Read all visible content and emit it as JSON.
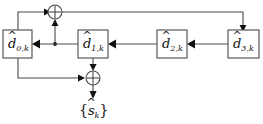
{
  "diagram": {
    "colors": {
      "line": "#4a4a4a",
      "arrow": "#111111",
      "box_fill": "#ffffff",
      "background": "#ffffff",
      "text": "#111111"
    },
    "registers": [
      {
        "id": "d0",
        "symbol": "d",
        "hat": "^",
        "subscript": "0,k",
        "label": "d̂0,k"
      },
      {
        "id": "d1",
        "symbol": "d",
        "hat": "^",
        "subscript": "1,k",
        "label": "d̂1,k"
      },
      {
        "id": "d2",
        "symbol": "d",
        "hat": "^",
        "subscript": "2,k",
        "label": "d̂2,k"
      },
      {
        "id": "d3",
        "symbol": "d",
        "hat": "^",
        "subscript": "3,k",
        "label": "d̂3,k"
      }
    ],
    "adders": [
      {
        "id": "adder-top",
        "glyph": "⊕",
        "name": "modulo-2-adder-top"
      },
      {
        "id": "adder-bottom",
        "glyph": "⊕",
        "name": "modulo-2-adder-bottom"
      }
    ],
    "output": {
      "open_brace": "{",
      "symbol": "s",
      "hat": "^",
      "subscript": "k",
      "close_brace": "}",
      "label": "{ŝk}"
    },
    "junctions": [
      {
        "id": "tap-d1-to-d0",
        "x": 55,
        "y": 44
      }
    ]
  }
}
